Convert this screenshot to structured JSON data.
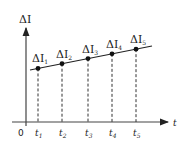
{
  "diagram": {
    "y_axis_label": "ΔI",
    "x_axis_label": "t",
    "origin_label": "0",
    "points": [
      {
        "label_main": "ΔI",
        "label_sub": "1",
        "tick_main": "t",
        "tick_sub": "1"
      },
      {
        "label_main": "ΔI",
        "label_sub": "2",
        "tick_main": "t",
        "tick_sub": "2"
      },
      {
        "label_main": "ΔI",
        "label_sub": "3",
        "tick_main": "t",
        "tick_sub": "3"
      },
      {
        "label_main": "ΔI",
        "label_sub": "4",
        "tick_main": "t",
        "tick_sub": "4"
      },
      {
        "label_main": "ΔI",
        "label_sub": "5",
        "tick_main": "t",
        "tick_sub": "5"
      }
    ]
  }
}
